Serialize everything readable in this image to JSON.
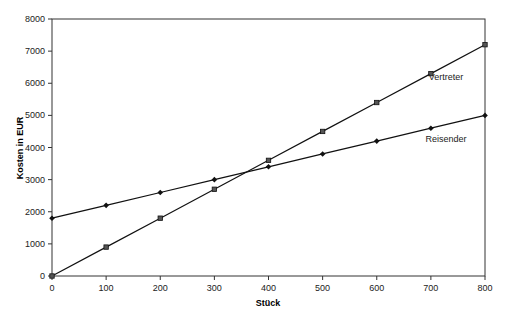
{
  "chart_data": {
    "type": "line",
    "title": "",
    "xlabel": "Stück",
    "ylabel": "Kosten in EUR",
    "xlim": [
      0,
      800
    ],
    "ylim": [
      0,
      8000
    ],
    "x": [
      0,
      100,
      200,
      300,
      400,
      500,
      600,
      700,
      800
    ],
    "x_ticks": [
      "0",
      "100",
      "200",
      "300",
      "400",
      "500",
      "600",
      "700",
      "800"
    ],
    "y_ticks": [
      "0",
      "1000",
      "2000",
      "3000",
      "4000",
      "5000",
      "6000",
      "7000",
      "8000"
    ],
    "grid": false,
    "legend": "inline labels",
    "series": [
      {
        "name": "Vertreter",
        "marker": "square",
        "values": [
          0,
          900,
          1800,
          2700,
          3600,
          4500,
          5400,
          6300,
          7200
        ]
      },
      {
        "name": "Reisender",
        "marker": "diamond",
        "values": [
          1800,
          2200,
          2600,
          3000,
          3400,
          3800,
          4200,
          4600,
          5000
        ]
      }
    ],
    "annotations": [
      {
        "text": "Vertreter",
        "near_x": 700,
        "near_y": 6300
      },
      {
        "text": "Reisender",
        "near_x": 700,
        "near_y": 4000
      }
    ]
  }
}
